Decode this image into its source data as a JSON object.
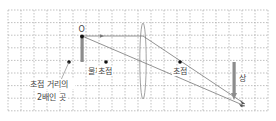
{
  "diagram": {
    "labels": {
      "object_point": "O",
      "object": "물체",
      "focus_left": "초점",
      "focus_right": "초점",
      "two_f_line1": "초점 거리의",
      "two_f_line2": "2배인 곳",
      "image": "상"
    },
    "colors": {
      "grid": "#9a9a9a",
      "arrow": "#8c8c8c",
      "ray": "#777777",
      "lens": "#888888",
      "point": "#111111",
      "text": "#444444"
    },
    "grid": {
      "x0": 8,
      "y0": 10,
      "x1": 268,
      "y1": 111,
      "cols": 20,
      "rows": 8
    }
  }
}
